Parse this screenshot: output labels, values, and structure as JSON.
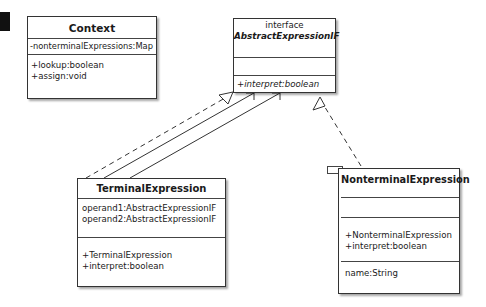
{
  "diagram": {
    "type": "uml-class-diagram",
    "classes": {
      "context": {
        "name": "Context",
        "attributes": [
          "-nonterminalExpressions:Map"
        ],
        "operations": [
          "+lookup:boolean",
          "+assign:void"
        ]
      },
      "abstract_expression": {
        "stereotype": "interface",
        "name": "AbstractExpressionIF",
        "attributes": [],
        "operations": [
          "+interpret:boolean"
        ]
      },
      "terminal_expression": {
        "name": "TerminalExpression",
        "attributes": [
          "operand1:AbstractExpressionIF",
          "operand2:AbstractExpressionIF"
        ],
        "operations": [
          "+TerminalExpression",
          "+interpret:boolean"
        ]
      },
      "nonterminal_expression": {
        "name": "NonterminalExpression",
        "attributes": [],
        "operations": [
          "+NonterminalExpression",
          "+interpret:boolean"
        ],
        "extra": [
          "name:String"
        ]
      }
    },
    "relationships": [
      {
        "from": "TerminalExpression",
        "to": "AbstractExpressionIF",
        "kind": "realization",
        "style": "dashed"
      },
      {
        "from": "TerminalExpression",
        "to": "AbstractExpressionIF",
        "kind": "association",
        "style": "solid"
      },
      {
        "from": "TerminalExpression",
        "to": "AbstractExpressionIF",
        "kind": "association",
        "style": "solid"
      },
      {
        "from": "NonterminalExpression",
        "to": "AbstractExpressionIF",
        "kind": "realization",
        "style": "dashed"
      }
    ]
  }
}
